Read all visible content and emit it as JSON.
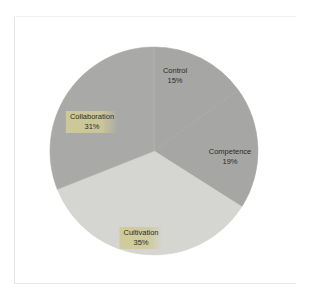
{
  "chart_data": {
    "type": "pie",
    "title": "",
    "start_angle_deg": 0,
    "direction": "clockwise",
    "categories": [
      "Control",
      "Competence",
      "Cultivation",
      "Collaboration"
    ],
    "values": [
      15,
      19,
      35,
      31
    ],
    "labels": [
      "15%",
      "19%",
      "35%",
      "31%"
    ],
    "colors": [
      "#a6a6a4",
      "#a6a6a4",
      "#d5d5d2",
      "#a9a9a7"
    ],
    "legend": "none",
    "highlighted_labels": [
      "Cultivation",
      "Collaboration"
    ]
  },
  "labels": {
    "control": {
      "name": "Control",
      "pct": "15%"
    },
    "competence": {
      "name": "Competence",
      "pct": "19%"
    },
    "cultivation": {
      "name": "Cultivation",
      "pct": "35%"
    },
    "collaboration": {
      "name": "Collaboration",
      "pct": "31%"
    }
  },
  "colors": {
    "background": "#ffffff",
    "frame": "#e6e6e6",
    "highlight": "#cfca96",
    "text": "#2a2a2a"
  }
}
